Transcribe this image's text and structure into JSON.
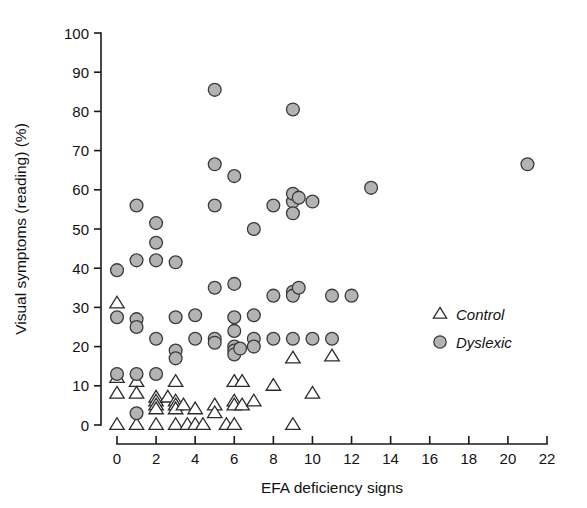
{
  "chart_data": {
    "type": "scatter",
    "title": "",
    "xlabel": "EFA deficiency signs",
    "ylabel": "Visual symptoms (reading) (%)",
    "xlim": [
      0,
      22
    ],
    "ylim": [
      0,
      100
    ],
    "xticks": [
      0,
      2,
      4,
      6,
      8,
      10,
      12,
      14,
      16,
      18,
      20,
      22
    ],
    "yticks": [
      0,
      10,
      20,
      30,
      40,
      50,
      60,
      70,
      80,
      90,
      100
    ],
    "grid": false,
    "legend_position": "right-middle",
    "series": [
      {
        "name": "Control",
        "marker": "triangle",
        "fill": "#ffffff",
        "edge": "#2b2b2b",
        "points": [
          [
            0,
            31
          ],
          [
            0,
            12
          ],
          [
            0,
            8
          ],
          [
            0,
            0
          ],
          [
            1,
            11
          ],
          [
            1,
            8
          ],
          [
            1,
            0
          ],
          [
            2,
            7
          ],
          [
            2,
            6
          ],
          [
            2,
            5
          ],
          [
            2,
            4
          ],
          [
            2,
            0
          ],
          [
            2.6,
            7
          ],
          [
            3,
            11
          ],
          [
            3,
            6
          ],
          [
            3,
            5
          ],
          [
            3,
            4
          ],
          [
            3,
            0
          ],
          [
            3.4,
            5
          ],
          [
            3.6,
            0
          ],
          [
            4,
            4
          ],
          [
            4,
            0
          ],
          [
            4.4,
            0
          ],
          [
            5,
            5
          ],
          [
            5,
            3
          ],
          [
            5.6,
            0
          ],
          [
            6,
            11
          ],
          [
            6,
            6
          ],
          [
            6,
            5
          ],
          [
            6,
            0
          ],
          [
            6.4,
            11
          ],
          [
            6.4,
            5
          ],
          [
            7,
            6
          ],
          [
            8,
            10
          ],
          [
            9,
            17
          ],
          [
            9,
            0
          ],
          [
            10,
            8
          ],
          [
            11,
            17.5
          ]
        ]
      },
      {
        "name": "Dyslexic",
        "marker": "circle",
        "fill": "#b3b3b3",
        "edge": "#3a3a3a",
        "points": [
          [
            0,
            39.5
          ],
          [
            0,
            27.5
          ],
          [
            0,
            13
          ],
          [
            1,
            56
          ],
          [
            1,
            42
          ],
          [
            1,
            27
          ],
          [
            1,
            25
          ],
          [
            1,
            13
          ],
          [
            1,
            3
          ],
          [
            2,
            51.5
          ],
          [
            2,
            46.5
          ],
          [
            2,
            42
          ],
          [
            2,
            22
          ],
          [
            2,
            13
          ],
          [
            3,
            41.5
          ],
          [
            3,
            27.5
          ],
          [
            3,
            19
          ],
          [
            3,
            17
          ],
          [
            4,
            22
          ],
          [
            4,
            28
          ],
          [
            5,
            85.5
          ],
          [
            5,
            66.5
          ],
          [
            5,
            56
          ],
          [
            5,
            35
          ],
          [
            5,
            22
          ],
          [
            5,
            21
          ],
          [
            6,
            63.5
          ],
          [
            6,
            36
          ],
          [
            6,
            27.5
          ],
          [
            6,
            24
          ],
          [
            6,
            20
          ],
          [
            6,
            19
          ],
          [
            6,
            18
          ],
          [
            6.3,
            19.5
          ],
          [
            7,
            50
          ],
          [
            7,
            28
          ],
          [
            7,
            22
          ],
          [
            7,
            20
          ],
          [
            8,
            56
          ],
          [
            8,
            33
          ],
          [
            8,
            22
          ],
          [
            9,
            80.5
          ],
          [
            9,
            57
          ],
          [
            9,
            59
          ],
          [
            9,
            54
          ],
          [
            9,
            34
          ],
          [
            9,
            33
          ],
          [
            9,
            22
          ],
          [
            9.3,
            58
          ],
          [
            9.3,
            35
          ],
          [
            10,
            57
          ],
          [
            10,
            22
          ],
          [
            11,
            33
          ],
          [
            11,
            22
          ],
          [
            12,
            33
          ],
          [
            13,
            60.5
          ],
          [
            21,
            66.5
          ]
        ]
      }
    ]
  },
  "legend": {
    "entries": [
      {
        "label": "Control",
        "marker": "triangle"
      },
      {
        "label": "Dyslexic",
        "marker": "circle"
      }
    ]
  },
  "axis_text": {
    "x_label": "EFA deficiency signs",
    "y_label": "Visual symptoms (reading) (%)",
    "x_tick_labels": [
      "0",
      "2",
      "4",
      "6",
      "8",
      "10",
      "12",
      "14",
      "16",
      "18",
      "20",
      "22"
    ],
    "y_tick_labels": [
      "0",
      "10",
      "20",
      "30",
      "40",
      "50",
      "60",
      "70",
      "80",
      "90",
      "100"
    ]
  },
  "colors": {
    "dyslexic_fill": "#b3b3b3",
    "marker_edge": "#3a3a3a",
    "axis": "#1a1a1a",
    "text": "#111111",
    "background": "#ffffff"
  }
}
